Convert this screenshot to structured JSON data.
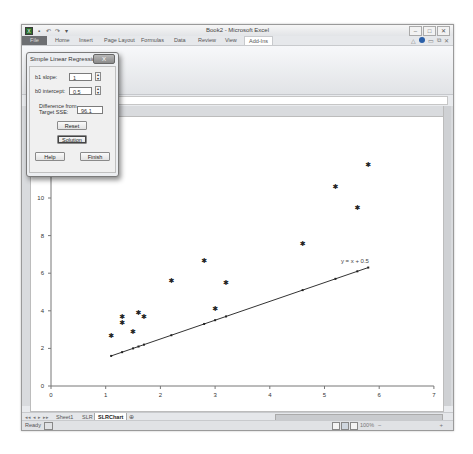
{
  "window": {
    "title": "Book2 - Microsoft Excel",
    "controls": [
      "minimize",
      "maximize",
      "close"
    ]
  },
  "quick_access": [
    "excel-logo",
    "save",
    "undo",
    "redo",
    "customize"
  ],
  "ribbon": {
    "tabs": [
      {
        "label": "File",
        "active": false
      },
      {
        "label": "Home",
        "active": false
      },
      {
        "label": "Insert",
        "active": false
      },
      {
        "label": "Page Layout",
        "active": false
      },
      {
        "label": "Formulas",
        "active": false
      },
      {
        "label": "Data",
        "active": false
      },
      {
        "label": "Review",
        "active": false
      },
      {
        "label": "View",
        "active": false
      },
      {
        "label": "Add-Ins",
        "active": true
      }
    ]
  },
  "formula_bar": {
    "fx_label": "fx",
    "value": ""
  },
  "dialog": {
    "title": "Simple Linear Regression",
    "close_label": "X",
    "b1_label": "b1 slope:",
    "b1_value": "1",
    "b0_label": "b0 intercept:",
    "b0_value": "0.5",
    "diff_label_1": "Difference from",
    "diff_label_2": "Target SSE:",
    "diff_value": "96.1",
    "reset_label": "Reset",
    "solution_label": "Solution",
    "help_label": "Help",
    "finish_label": "Finish"
  },
  "sheet_tabs": {
    "nav": [
      "◂◂",
      "◂",
      "▸",
      "▸▸"
    ],
    "tabs": [
      {
        "label": "Sheet1",
        "active": false
      },
      {
        "label": "SLR",
        "active": false
      },
      {
        "label": "SLRChart",
        "active": true
      }
    ]
  },
  "status_bar": {
    "ready": "Ready",
    "zoom": "100%",
    "zoom_minus": "−",
    "zoom_plus": "+"
  },
  "chart_data": {
    "type": "scatter",
    "title": "",
    "xlabel": "",
    "ylabel": "",
    "xlim": [
      0,
      7
    ],
    "ylim": [
      0,
      12
    ],
    "x_ticks": [
      0,
      1,
      2,
      3,
      4,
      5,
      6,
      7
    ],
    "y_ticks": [
      0,
      2,
      4,
      6,
      8,
      10
    ],
    "grid": false,
    "series": [
      {
        "name": "Observed",
        "marker": "star",
        "points": [
          [
            1.1,
            2.7
          ],
          [
            1.3,
            3.4
          ],
          [
            1.3,
            3.7
          ],
          [
            1.5,
            2.9
          ],
          [
            1.6,
            3.9
          ],
          [
            1.7,
            3.7
          ],
          [
            2.2,
            5.6
          ],
          [
            2.8,
            6.7
          ],
          [
            3.0,
            4.1
          ],
          [
            3.2,
            5.5
          ],
          [
            4.6,
            7.6
          ],
          [
            5.2,
            10.6
          ],
          [
            5.6,
            9.5
          ],
          [
            5.8,
            11.8
          ]
        ]
      },
      {
        "name": "Fitted line",
        "marker": "dot",
        "line": true,
        "points": [
          [
            1.1,
            1.6
          ],
          [
            1.3,
            1.8
          ],
          [
            1.5,
            2.0
          ],
          [
            1.6,
            2.1
          ],
          [
            1.7,
            2.2
          ],
          [
            2.2,
            2.7
          ],
          [
            2.8,
            3.3
          ],
          [
            3.0,
            3.5
          ],
          [
            3.2,
            3.7
          ],
          [
            4.6,
            5.1
          ],
          [
            5.2,
            5.7
          ],
          [
            5.6,
            6.1
          ],
          [
            5.8,
            6.3
          ]
        ]
      }
    ],
    "annotations": [
      {
        "text": "y = x + 0.5",
        "x": 5.3,
        "y": 6.6
      }
    ]
  }
}
